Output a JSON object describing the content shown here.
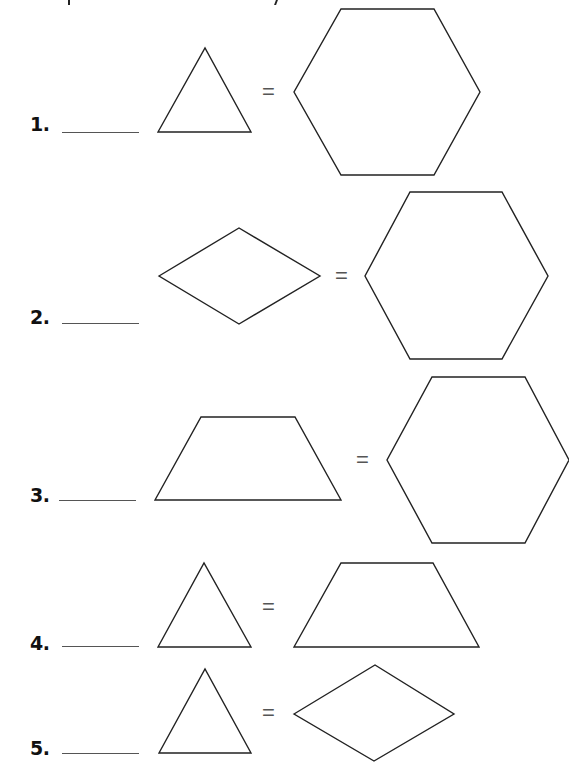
{
  "worksheet": {
    "items": [
      {
        "number": "1.",
        "answer": "",
        "left_shape": "triangle",
        "equals": "=",
        "right_shape": "hexagon"
      },
      {
        "number": "2.",
        "answer": "",
        "left_shape": "rhombus",
        "equals": "=",
        "right_shape": "hexagon"
      },
      {
        "number": "3.",
        "answer": "",
        "left_shape": "trapezoid",
        "equals": "=",
        "right_shape": "hexagon"
      },
      {
        "number": "4.",
        "answer": "",
        "left_shape": "triangle",
        "equals": "=",
        "right_shape": "trapezoid"
      },
      {
        "number": "5.",
        "answer": "",
        "left_shape": "triangle",
        "equals": "=",
        "right_shape": "rhombus"
      }
    ],
    "colors": {
      "stroke": "#222222",
      "background": "#ffffff"
    }
  }
}
